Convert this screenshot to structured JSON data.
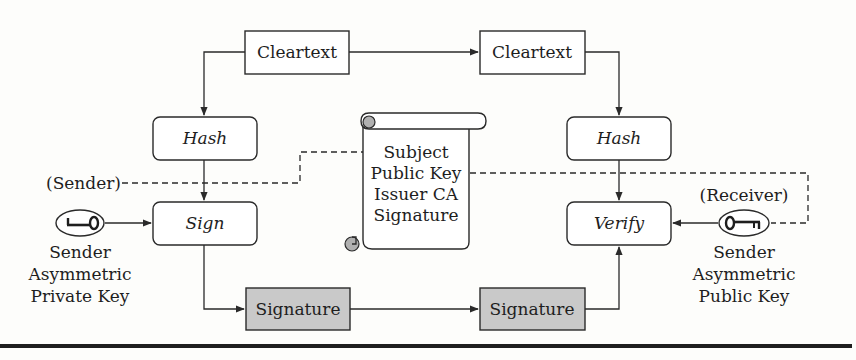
{
  "diagram": {
    "nodes": {
      "cleartext_sender": {
        "label": "Cleartext"
      },
      "cleartext_receiver": {
        "label": "Cleartext"
      },
      "hash_sender": {
        "label": "Hash"
      },
      "hash_receiver": {
        "label": "Hash"
      },
      "sign": {
        "label": "Sign"
      },
      "verify": {
        "label": "Verify"
      },
      "signature_sender": {
        "label": "Signature"
      },
      "signature_receiver": {
        "label": "Signature"
      },
      "certificate": {
        "lines": [
          "Subject",
          "Public Key",
          "Issuer CA",
          "Signature"
        ]
      },
      "sender_role": {
        "label": "(Sender)"
      },
      "receiver_role": {
        "label": "(Receiver)"
      },
      "private_key": {
        "icon": "key-icon",
        "lines": [
          "Sender",
          "Asymmetric",
          "Private Key"
        ]
      },
      "public_key": {
        "icon": "key-icon",
        "lines": [
          "Sender",
          "Asymmetric",
          "Public Key"
        ]
      }
    },
    "edges": [
      {
        "from": "cleartext_sender",
        "to": "cleartext_receiver",
        "style": "solid"
      },
      {
        "from": "cleartext_sender",
        "to": "hash_sender",
        "style": "solid"
      },
      {
        "from": "cleartext_receiver",
        "to": "hash_receiver",
        "style": "solid"
      },
      {
        "from": "hash_sender",
        "to": "sign",
        "style": "solid"
      },
      {
        "from": "private_key",
        "to": "sign",
        "style": "solid"
      },
      {
        "from": "sign",
        "to": "signature_sender",
        "style": "solid"
      },
      {
        "from": "signature_sender",
        "to": "signature_receiver",
        "style": "solid"
      },
      {
        "from": "signature_receiver",
        "to": "verify",
        "style": "solid"
      },
      {
        "from": "hash_receiver",
        "to": "verify",
        "style": "solid"
      },
      {
        "from": "public_key",
        "to": "verify",
        "style": "solid"
      },
      {
        "from": "sender_role",
        "to": "certificate.subject",
        "style": "dashed"
      },
      {
        "from": "certificate.public_key",
        "to": "public_key",
        "style": "dashed"
      }
    ],
    "colors": {
      "stroke": "#2a2a2a",
      "box_fill": "#ffffff",
      "shaded_fill": "#c9c9c9",
      "curl_fill": "#b0b0b0",
      "background": "#fdfdfb"
    }
  }
}
